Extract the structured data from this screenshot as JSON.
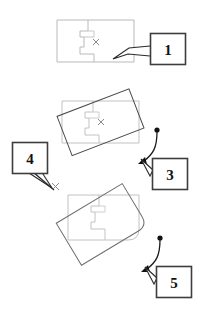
{
  "figure": {
    "kind": "technical-illustration",
    "background_color": "#ffffff",
    "colors": {
      "original_outline": "#b9b9b9",
      "ghost_outline": "#c2c2c2",
      "rotated_outline": "#4a4a4a",
      "callout_box_border": "#4a4a4a",
      "callout_text": "#111111",
      "arrow": "#1a1a1a",
      "basepoint_marker": "#8a8a8a"
    },
    "callouts": [
      {
        "id": "callout-1",
        "label": "1",
        "box": {
          "x": 150,
          "y": 33,
          "w": 36,
          "h": 32
        },
        "points_to": "selected-shape-edge",
        "tail": [
          [
            150,
            55
          ],
          [
            130,
            53
          ],
          [
            118,
            58
          ],
          [
            131,
            47
          ],
          [
            150,
            45
          ]
        ]
      },
      {
        "id": "callout-3",
        "label": "3",
        "box": {
          "x": 152,
          "y": 158,
          "w": 36,
          "h": 32
        },
        "points_to": "rotation-arrow-middle",
        "tail": [
          [
            152,
            170
          ],
          [
            140,
            160
          ],
          [
            148,
            174
          ]
        ]
      },
      {
        "id": "callout-4",
        "label": "4",
        "box": {
          "x": 12,
          "y": 142,
          "w": 36,
          "h": 32
        },
        "points_to": "base-point-marker",
        "tail": [
          [
            30,
            174
          ],
          [
            50,
            186
          ],
          [
            42,
            172
          ]
        ]
      },
      {
        "id": "callout-5",
        "label": "5",
        "box": {
          "x": 156,
          "y": 266,
          "w": 36,
          "h": 32
        },
        "points_to": "rotation-arrow-bottom",
        "tail": [
          [
            156,
            278
          ],
          [
            144,
            268
          ],
          [
            152,
            282
          ]
        ]
      }
    ],
    "stages": [
      {
        "id": "stage-1-original",
        "name": "original-shape-selected",
        "has_basepoint_marker": true,
        "basepoint": {
          "x": 96,
          "y": 42
        },
        "rotation_deg": 0
      },
      {
        "id": "stage-2-rotating",
        "name": "shape-being-rotated",
        "has_basepoint_marker": true,
        "basepoint": {
          "x": 101,
          "y": 122
        },
        "rotation_deg": -21,
        "has_rotation_arrow": true
      },
      {
        "id": "stage-3-rotated",
        "name": "shape-rotated-result",
        "has_basepoint_marker": false,
        "rotation_deg": -31,
        "has_rotation_arrow": true
      }
    ],
    "markers": {
      "basepoint_glyph": "x",
      "rotation_arrow_dot": "filled-circle",
      "rotation_arrow_head": "solid-triangle"
    }
  }
}
